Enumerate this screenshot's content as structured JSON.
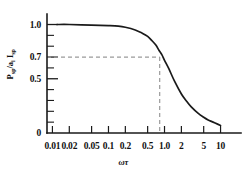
{
  "chart_data": {
    "type": "line",
    "title": "",
    "xlabel": "ωτ",
    "ylabel": "P_sp/a_i I_sp",
    "xscale": "log",
    "xlim": [
      0.008,
      16
    ],
    "ylim": [
      0,
      1.06
    ],
    "grid": false,
    "legend": null,
    "xticks": [
      {
        "value": 0.01,
        "label": "0.01"
      },
      {
        "value": 0.02,
        "label": "0.02"
      },
      {
        "value": 0.05,
        "label": "0.05"
      },
      {
        "value": 0.1,
        "label": "0.1"
      },
      {
        "value": 0.2,
        "label": "0.2"
      },
      {
        "value": 0.5,
        "label": "0.5"
      },
      {
        "value": 1.0,
        "label": "1.0"
      },
      {
        "value": 2,
        "label": "2"
      },
      {
        "value": 5,
        "label": "5"
      },
      {
        "value": 10,
        "label": "10"
      }
    ],
    "yticks_labeled": [
      {
        "value": 1.0,
        "label": "1.0"
      },
      {
        "value": 0.7,
        "label": "0.7"
      },
      {
        "value": 0.5,
        "label": "0.5"
      },
      {
        "value": 0.0,
        "label": "0"
      }
    ],
    "yticks_minor": [
      0.1,
      0.2,
      0.3,
      0.4,
      0.6,
      0.8,
      0.9
    ],
    "series": [
      {
        "name": "normalized sputtering response",
        "style": "solid",
        "color": "#1a1a1a",
        "x": [
          0.012,
          0.02,
          0.05,
          0.1,
          0.15,
          0.2,
          0.3,
          0.4,
          0.5,
          0.6,
          0.7,
          0.8,
          0.9,
          1.0,
          1.2,
          1.5,
          2.0,
          2.5,
          3.0,
          4.0,
          5.0,
          6.0,
          7.0,
          8.0,
          10.0
        ],
        "y": [
          1.0,
          1.0,
          0.995,
          0.99,
          0.985,
          0.975,
          0.95,
          0.92,
          0.89,
          0.85,
          0.81,
          0.76,
          0.72,
          0.67,
          0.59,
          0.48,
          0.36,
          0.29,
          0.24,
          0.18,
          0.145,
          0.12,
          0.105,
          0.092,
          0.07
        ]
      }
    ],
    "annotations": [
      {
        "type": "dashed-guide",
        "style": "dashed",
        "color": "#9a9a9a",
        "description": "horizontal guide at 0.7 from y-axis to curve, then vertical guide down to x-axis",
        "y_value": 0.7,
        "x_value": 0.82
      }
    ]
  }
}
